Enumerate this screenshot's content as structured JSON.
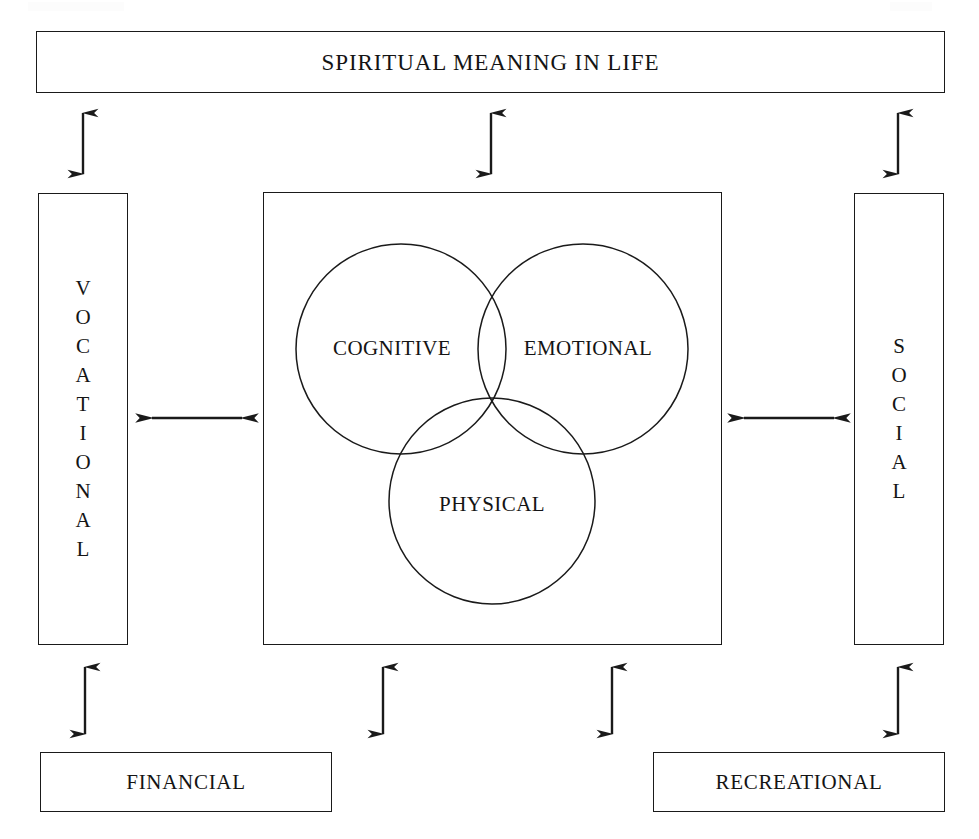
{
  "diagram": {
    "title": "SPIRITUAL MEANING IN LIFE",
    "type": "wellness-dimensions-model",
    "colors": {
      "line": "#1a1a1a",
      "text": "#141414",
      "background": "#ffffff"
    },
    "top_box": {
      "label": "SPIRITUAL MEANING IN LIFE"
    },
    "left_box": {
      "label": "VOCATIONAL",
      "orientation": "vertical-stacked-letters"
    },
    "right_box": {
      "label": "SOCIAL",
      "orientation": "vertical-stacked-letters"
    },
    "bottom_left_box": {
      "label": "FINANCIAL"
    },
    "bottom_right_box": {
      "label": "RECREATIONAL"
    },
    "center": {
      "venn": {
        "circles": [
          {
            "label": "COGNITIVE",
            "cx": 400,
            "cy": 348,
            "r": 105
          },
          {
            "label": "EMOTIONAL",
            "cx": 582,
            "cy": 348,
            "r": 105
          },
          {
            "label": "PHYSICAL",
            "cx": 491,
            "cy": 500,
            "r": 103
          }
        ]
      }
    },
    "connectors": [
      {
        "name": "spiritual-to-vocational",
        "direction": "double",
        "axis": "vertical",
        "x": 83,
        "y1": 100,
        "y2": 186
      },
      {
        "name": "spiritual-to-center",
        "direction": "double",
        "axis": "vertical",
        "x": 491,
        "y1": 100,
        "y2": 186
      },
      {
        "name": "spiritual-to-social",
        "direction": "double",
        "axis": "vertical",
        "x": 898,
        "y1": 100,
        "y2": 186
      },
      {
        "name": "vocational-to-center",
        "direction": "double",
        "axis": "horizontal",
        "y": 418,
        "x1": 136,
        "x2": 256
      },
      {
        "name": "center-to-social",
        "direction": "double",
        "axis": "horizontal",
        "y": 418,
        "x1": 729,
        "x2": 849
      },
      {
        "name": "vocational-to-financial",
        "direction": "double",
        "axis": "vertical",
        "x": 85,
        "y1": 654,
        "y2": 746
      },
      {
        "name": "center-to-financial",
        "direction": "double",
        "axis": "vertical",
        "x": 383,
        "y1": 654,
        "y2": 746
      },
      {
        "name": "center-to-recreational",
        "direction": "double",
        "axis": "vertical",
        "x": 612,
        "y1": 654,
        "y2": 746
      },
      {
        "name": "social-to-recreational",
        "direction": "double",
        "axis": "vertical",
        "x": 898,
        "y1": 654,
        "y2": 746
      }
    ]
  }
}
